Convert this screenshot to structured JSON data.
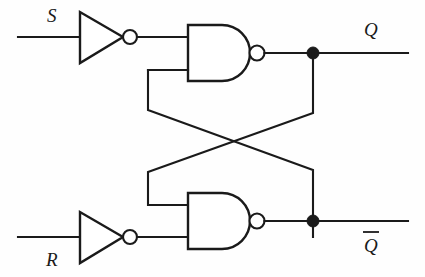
{
  "diagram": {
    "type": "logic-circuit-schematic",
    "background_color": "#fefefe",
    "line_color": "#1a1a1a",
    "canvas": {
      "width": 425,
      "height": 277
    },
    "labels": {
      "set_input": "S",
      "reset_input": "R",
      "q_output": "Q",
      "q_not_output": "Q"
    },
    "components": [
      {
        "id": "inverter-top",
        "name": "inverter-set",
        "type": "NOT",
        "has_bubble": true,
        "input_net": "S",
        "output_net": "S-inverted"
      },
      {
        "id": "inverter-bottom",
        "name": "inverter-reset",
        "type": "NOT",
        "has_bubble": true,
        "input_net": "R",
        "output_net": "R-inverted"
      },
      {
        "id": "nand-top",
        "name": "nand-gate-q",
        "type": "NAND",
        "inputs": 2,
        "has_bubble": true,
        "input_nets": [
          "S-inverted",
          "Q-not-feedback"
        ],
        "output_net": "Q"
      },
      {
        "id": "nand-bottom",
        "name": "nand-gate-q-not",
        "type": "NAND",
        "inputs": 2,
        "has_bubble": true,
        "input_nets": [
          "Q-feedback",
          "R-inverted"
        ],
        "output_net": "Q-not"
      }
    ],
    "nets": [
      {
        "name": "S-input-line",
        "from": "S",
        "to": "inverter-top"
      },
      {
        "name": "R-input-line",
        "from": "R",
        "to": "inverter-bottom"
      },
      {
        "name": "Q-output-line",
        "from": "nand-top",
        "to": "Q"
      },
      {
        "name": "Q-not-output-line",
        "from": "nand-bottom",
        "to": "Q-not"
      },
      {
        "name": "cross-coupling-q-to-lower-gate",
        "from": "Q",
        "to": "nand-bottom.input-1"
      },
      {
        "name": "cross-coupling-qnot-to-upper-gate",
        "from": "Q-not",
        "to": "nand-top.input-2"
      }
    ],
    "junctions": [
      {
        "name": "q-tap",
        "x": 313,
        "y": 57
      },
      {
        "name": "q-not-tap",
        "x": 313,
        "y": 237
      }
    ]
  }
}
